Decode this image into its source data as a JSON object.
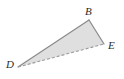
{
  "figure": {
    "kind": "geometry-figure",
    "shape": "triangle",
    "canvas": {
      "width": 124,
      "height": 79
    },
    "background_color": "#ffffff",
    "fill_color": "#dfdfdf",
    "stroke_color": "#8a8a8a",
    "dashed_stroke_color": "#9a9a9a",
    "label_color": "#2b2b2b",
    "stroke_width": 1.2,
    "dash_pattern": "3 2",
    "vertices": [
      {
        "name": "D",
        "label": "D",
        "x": 18,
        "y": 67
      },
      {
        "name": "B",
        "label": "B",
        "x": 89,
        "y": 20
      },
      {
        "name": "E",
        "label": "E",
        "x": 104,
        "y": 44
      }
    ],
    "edges": [
      {
        "name": "edge-DB",
        "from": "D",
        "to": "B",
        "style": "solid"
      },
      {
        "name": "edge-BE",
        "from": "B",
        "to": "E",
        "style": "solid"
      },
      {
        "name": "edge-DE",
        "from": "D",
        "to": "E",
        "style": "dashed"
      }
    ],
    "polygon_points": "18,67 89,20 104,44",
    "labels": {
      "B": "B",
      "E": "E",
      "D": "D"
    }
  }
}
